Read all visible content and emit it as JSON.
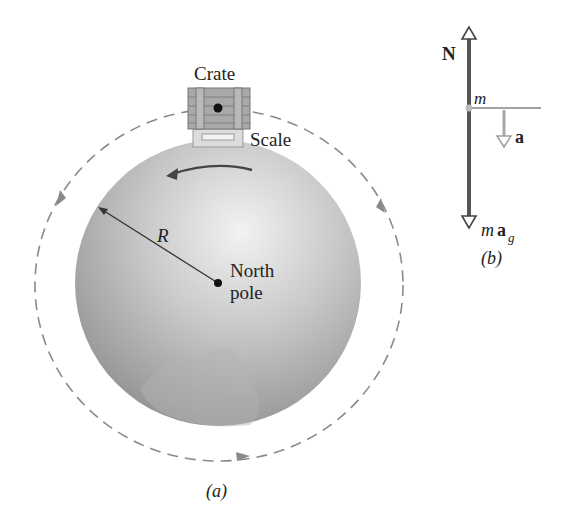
{
  "figure_a": {
    "labels": {
      "crate": "Crate",
      "scale": "Scale",
      "radius": "R",
      "north_line1": "North",
      "north_line2": "pole",
      "caption": "(a)"
    }
  },
  "figure_b": {
    "labels": {
      "normal_force": "N",
      "mass": "m",
      "acceleration": "a",
      "gravity_m": "m",
      "gravity_a": "a",
      "gravity_sub": "g",
      "caption": "(b)"
    }
  },
  "colors": {
    "globe_light": "#e8e8e8",
    "globe_dark": "#9a9a9a",
    "dashed_orbit": "#8a8a8a",
    "force_vector": "#555555",
    "accel_vector": "#a8a8a8"
  }
}
